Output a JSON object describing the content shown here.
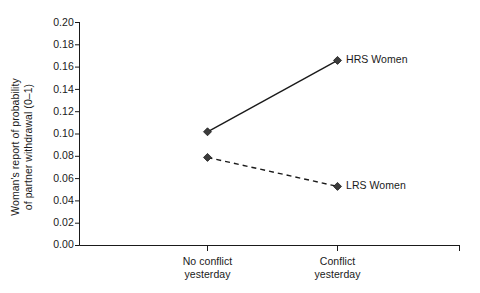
{
  "chart_data": {
    "type": "line",
    "title": "",
    "subtitle": "",
    "xlabel": "",
    "ylabel": "Woman's report of probability of partner withdrawal (0–1)",
    "ylabel_lines": [
      "Woman's report of probability",
      "of partner withdrawal (0–1)"
    ],
    "categories": [
      "No conflict yesterday",
      "Conflict yesterday"
    ],
    "category_lines": [
      [
        "No conflict",
        "yesterday"
      ],
      [
        "Conflict",
        "yesterday"
      ]
    ],
    "ylim": [
      0.0,
      0.2
    ],
    "ytick_step": 0.02,
    "ytick_labels": [
      "0.20",
      "0.18",
      "0.16",
      "0.14",
      "0.12",
      "0.10",
      "0.08",
      "0.06",
      "0.04",
      "0.02",
      "0.00"
    ],
    "ytick_values": [
      0.2,
      0.18,
      0.16,
      0.14,
      0.12,
      0.1,
      0.08,
      0.06,
      0.04,
      0.02,
      0.0
    ],
    "grid": false,
    "legend_position": "inline-right-of-endpoint",
    "series": [
      {
        "name": "HRS Women",
        "label": "HRS Women",
        "linestyle": "solid",
        "marker": "diamond",
        "color": "#1a1a1a",
        "values": [
          0.102,
          0.166
        ]
      },
      {
        "name": "LRS Women",
        "label": "LRS Women",
        "linestyle": "dashed",
        "marker": "diamond",
        "color": "#1a1a1a",
        "values": [
          0.079,
          0.053
        ]
      }
    ],
    "annotations": []
  },
  "axes": {
    "y_axis_line_color": "#1a1a1a",
    "x_axis_line_color": "#1a1a1a",
    "tick_color": "#1a1a1a"
  }
}
